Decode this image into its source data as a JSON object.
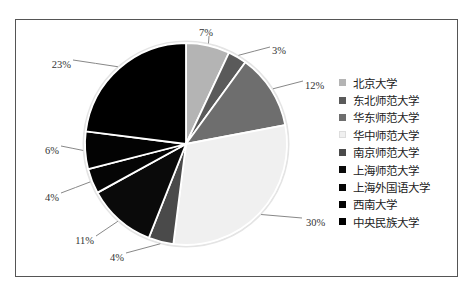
{
  "chart_data": {
    "type": "pie",
    "title": "",
    "categories": [
      "北京大学",
      "东北师范大学",
      "华东师范大学",
      "华中师范大学",
      "南京师范大学",
      "上海师范大学",
      "上海外国语大学",
      "西南大学",
      "中央民族大学"
    ],
    "values": [
      7,
      3,
      12,
      30,
      4,
      11,
      4,
      6,
      23
    ],
    "labels": [
      "7%",
      "3%",
      "12%",
      "30%",
      "4%",
      "11%",
      "4%",
      "6%",
      "23%"
    ],
    "colors": [
      "#b4b4b4",
      "#5a5a5a",
      "#6e6e6e",
      "#f0f0f0",
      "#4a4a4a",
      "#0a0a0a",
      "#050505",
      "#030303",
      "#000000"
    ],
    "legend_position": "right",
    "start_angle_deg": 0,
    "direction": "clockwise"
  },
  "legend": {
    "items": [
      {
        "label": "北京大学",
        "color": "#b4b4b4"
      },
      {
        "label": "东北师范大学",
        "color": "#5a5a5a"
      },
      {
        "label": "华东师范大学",
        "color": "#6e6e6e"
      },
      {
        "label": "华中师范大学",
        "color": "#f0f0f0"
      },
      {
        "label": "南京师范大学",
        "color": "#4a4a4a"
      },
      {
        "label": "上海师范大学",
        "color": "#0a0a0a"
      },
      {
        "label": "上海外国语大学",
        "color": "#050505"
      },
      {
        "label": "西南大学",
        "color": "#030303"
      },
      {
        "label": "中央民族大学",
        "color": "#000000"
      }
    ]
  }
}
